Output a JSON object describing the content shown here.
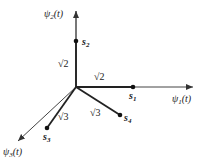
{
  "diagram": {
    "type": "signal-space-3d",
    "axes": [
      {
        "id": "psi1",
        "label": "ψ",
        "sub": "1",
        "arg": "(t)"
      },
      {
        "id": "psi2",
        "label": "ψ",
        "sub": "2",
        "arg": "(t)"
      },
      {
        "id": "psi3",
        "label": "ψ",
        "sub": "3",
        "arg": "(t)"
      }
    ],
    "points": [
      {
        "id": "s1",
        "label": "s",
        "sub": "1",
        "axis": "psi1",
        "magnitude_label": "√2"
      },
      {
        "id": "s2",
        "label": "s",
        "sub": "2",
        "axis": "psi2",
        "magnitude_label": "√2"
      },
      {
        "id": "s3",
        "label": "s",
        "sub": "3",
        "magnitude_label": "√3"
      },
      {
        "id": "s4",
        "label": "s",
        "sub": "4",
        "magnitude_label": "√3"
      }
    ],
    "colors": {
      "line": "#222222",
      "axis": "#555555",
      "text": "#222222"
    }
  }
}
